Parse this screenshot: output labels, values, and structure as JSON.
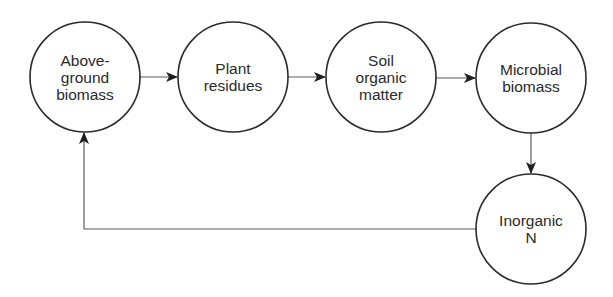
{
  "diagram": {
    "title": "",
    "stroke_color": "#2b2b2b",
    "line_color": "#6a6a6a",
    "nodes": [
      {
        "id": "aboveground",
        "label": "Above-\nground\nbiomass",
        "cx": 85,
        "cy": 77,
        "r": 55
      },
      {
        "id": "plant-residues",
        "label": "Plant\nresidues",
        "cx": 233,
        "cy": 77,
        "r": 55
      },
      {
        "id": "soil-organic-matter",
        "label": "Soil\norganic\nmatter",
        "cx": 381,
        "cy": 77,
        "r": 55
      },
      {
        "id": "microbial-biomass",
        "label": "Microbial\nbiomass",
        "cx": 531,
        "cy": 78,
        "r": 55
      },
      {
        "id": "inorganic-n",
        "label": "Inorganic\nN",
        "cx": 531,
        "cy": 229,
        "r": 55
      }
    ],
    "edges": [
      {
        "from": "aboveground",
        "to": "plant-residues"
      },
      {
        "from": "plant-residues",
        "to": "soil-organic-matter"
      },
      {
        "from": "soil-organic-matter",
        "to": "microbial-biomass"
      },
      {
        "from": "microbial-biomass",
        "to": "inorganic-n"
      },
      {
        "from": "inorganic-n",
        "to": "aboveground"
      }
    ]
  }
}
